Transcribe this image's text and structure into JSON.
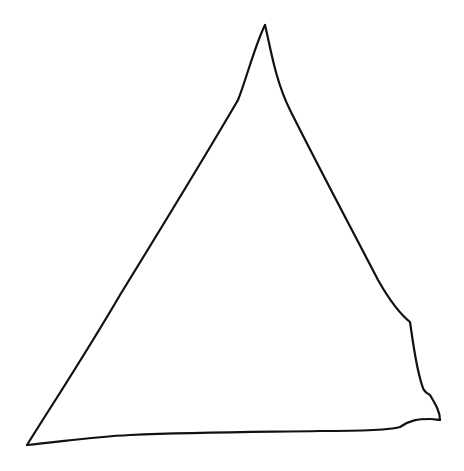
{
  "drawing": {
    "subject": "hand-drawn triangle",
    "background": "#ffffff",
    "stroke_color": "#111111",
    "stroke_width": 2.2,
    "vertices": {
      "apex": [
        265,
        25
      ],
      "bottom_left": [
        27,
        445
      ],
      "bottom_right": [
        440,
        420
      ]
    },
    "paths": {
      "left_edge": "M265,25 C255,45 246,80 238,100 C200,165 160,230 120,295 C85,355 55,400 27,445",
      "right_edge": "M265,25 C270,45 275,80 290,110 C320,170 360,245 378,280 C395,310 405,318 410,322 C412,335 415,360 420,378 C423,390 424,392 430,395 C436,405 440,412 440,420",
      "bottom_edge": "M27,445 C60,442 90,437 130,435 C200,432 260,432 320,431 C360,431 390,430 400,427 C410,420 418,419 430,419 C435,419 438,420 440,420"
    }
  }
}
